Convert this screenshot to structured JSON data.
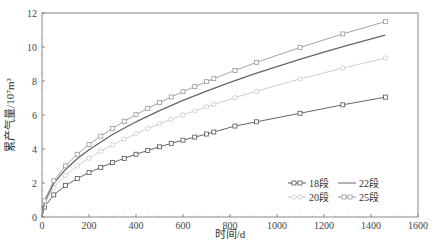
{
  "chart_data": {
    "type": "line",
    "title": "",
    "xlabel": "时间/d",
    "ylabel": "累产气量/10⁷m³",
    "xlim": [
      0,
      1600
    ],
    "ylim": [
      0,
      12
    ],
    "xticks": [
      0,
      200,
      400,
      600,
      800,
      1000,
      1200,
      1400,
      1600
    ],
    "yticks": [
      0,
      2,
      4,
      6,
      8,
      10,
      12
    ],
    "grid": false,
    "legend_position": "lower right",
    "series": [
      {
        "name": "18段",
        "color": "#555555",
        "marker": "square",
        "x": [
          0,
          10,
          50,
          100,
          150,
          200,
          250,
          300,
          350,
          400,
          450,
          500,
          550,
          600,
          650,
          700,
          731,
          821,
          913,
          1098,
          1280,
          1462
        ],
        "y": [
          0,
          0.58,
          1.3,
          1.85,
          2.26,
          2.61,
          2.92,
          3.2,
          3.45,
          3.69,
          3.91,
          4.13,
          4.33,
          4.52,
          4.7,
          4.88,
          5.0,
          5.35,
          5.6,
          6.1,
          6.6,
          7.05
        ]
      },
      {
        "name": "20段",
        "color": "#c8c8c8",
        "marker": "circle",
        "x": [
          0,
          10,
          50,
          100,
          150,
          200,
          250,
          300,
          350,
          400,
          450,
          500,
          550,
          600,
          650,
          700,
          731,
          821,
          913,
          1098,
          1280,
          1462
        ],
        "y": [
          0,
          0.77,
          1.73,
          2.45,
          3.0,
          3.46,
          3.87,
          4.24,
          4.58,
          4.9,
          5.2,
          5.48,
          5.75,
          6.0,
          6.25,
          6.48,
          6.62,
          7.02,
          7.4,
          8.12,
          8.76,
          9.35
        ]
      },
      {
        "name": "22段",
        "color": "#666666",
        "marker": "none",
        "x": [
          0,
          10,
          50,
          100,
          150,
          200,
          300,
          400,
          500,
          600,
          700,
          800,
          900,
          1000,
          1100,
          1200,
          1300,
          1460
        ],
        "y": [
          0,
          0.88,
          1.98,
          2.8,
          3.43,
          3.96,
          4.85,
          5.6,
          6.26,
          6.86,
          7.41,
          7.92,
          8.4,
          8.85,
          9.29,
          9.7,
          10.1,
          10.7
        ]
      },
      {
        "name": "25段",
        "color": "#999999",
        "marker": "square",
        "x": [
          0,
          10,
          50,
          100,
          150,
          200,
          250,
          300,
          350,
          400,
          450,
          500,
          550,
          600,
          650,
          700,
          731,
          821,
          913,
          1098,
          1280,
          1462
        ],
        "y": [
          0,
          0.95,
          2.13,
          3.01,
          3.69,
          4.26,
          4.76,
          5.21,
          5.63,
          6.02,
          6.39,
          6.73,
          7.06,
          7.37,
          7.67,
          7.96,
          8.14,
          8.62,
          9.1,
          9.97,
          10.77,
          11.5
        ]
      }
    ]
  },
  "caption": "图… 不同压裂段数下累计产气量变化曲线"
}
